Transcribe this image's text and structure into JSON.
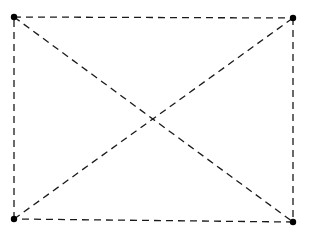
{
  "diagram": {
    "type": "complete-graph-K4",
    "line_style": "dashed",
    "stroke_color": "#1a1a1a",
    "node_color": "#000000",
    "nodes": [
      {
        "id": "top-left",
        "x": 14,
        "y": 17
      },
      {
        "id": "top-right",
        "x": 293,
        "y": 18
      },
      {
        "id": "bottom-left",
        "x": 14,
        "y": 219
      },
      {
        "id": "bottom-right",
        "x": 293,
        "y": 222
      }
    ],
    "edges": [
      {
        "from": "top-left",
        "to": "top-right"
      },
      {
        "from": "top-right",
        "to": "bottom-right"
      },
      {
        "from": "bottom-right",
        "to": "bottom-left"
      },
      {
        "from": "bottom-left",
        "to": "top-left"
      },
      {
        "from": "top-left",
        "to": "bottom-right"
      },
      {
        "from": "bottom-left",
        "to": "top-right"
      }
    ]
  }
}
